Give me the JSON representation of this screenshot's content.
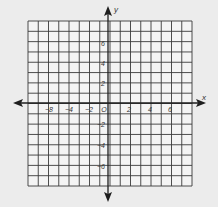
{
  "chart_data": {
    "type": "coordinate-grid",
    "title": "",
    "xlabel": "x",
    "ylabel": "y",
    "origin_label": "O",
    "grid": true,
    "xlim": [
      -8,
      8
    ],
    "ylim": [
      -8,
      8
    ],
    "x_tick_labels": [
      {
        "value": -6,
        "text": "−8"
      },
      {
        "value": -4,
        "text": "−4"
      },
      {
        "value": -2,
        "text": "−2"
      },
      {
        "value": 2,
        "text": "2"
      },
      {
        "value": 4,
        "text": "4"
      },
      {
        "value": 6,
        "text": "6"
      }
    ],
    "y_tick_labels": [
      {
        "value": 6,
        "text": "6"
      },
      {
        "value": 4,
        "text": "4"
      },
      {
        "value": 2,
        "text": "2"
      },
      {
        "value": -2,
        "text": "−2"
      },
      {
        "value": -4,
        "text": "−4"
      },
      {
        "value": -6,
        "text": "−6"
      }
    ],
    "series": []
  },
  "labels": {
    "x_axis": "x",
    "y_axis": "y",
    "origin": "O"
  },
  "colors": {
    "background": "#ececec",
    "grid_panel": "#f4f4f4",
    "grid_line": "#3a3a3a",
    "axis": "#1e1e1e"
  }
}
